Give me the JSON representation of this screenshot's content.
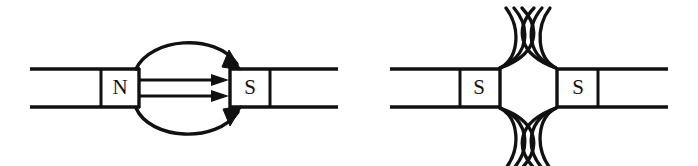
{
  "figure": {
    "background_color": "#ffffff",
    "stroke_color": "#111111",
    "width": 698,
    "height": 166
  },
  "diagrams": [
    {
      "id": "attraction",
      "name": "unlike-poles-attract",
      "left_magnet": {
        "pole_label": "N",
        "label_x": 120,
        "label_y": 88
      },
      "right_magnet": {
        "pole_label": "S",
        "label_x": 249,
        "label_y": 88
      },
      "field_lines": {
        "straight_count": 2,
        "arc_count": 2,
        "direction": "north-to-south",
        "arrowheads": 4
      }
    },
    {
      "id": "repulsion",
      "name": "like-poles-repel",
      "left_magnet": {
        "pole_label": "S",
        "label_x": 478,
        "label_y": 88
      },
      "right_magnet": {
        "pole_label": "S",
        "label_x": 578,
        "label_y": 88
      },
      "field_lines": {
        "arcs_per_corner": 3,
        "corners": 4,
        "total_arcs": 12,
        "direction": "outward-repelling",
        "arrowheads": 0
      }
    }
  ]
}
